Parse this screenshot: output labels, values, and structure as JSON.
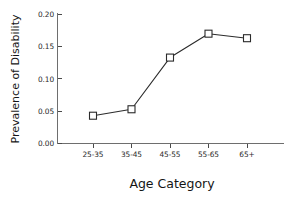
{
  "chart_data": {
    "type": "line",
    "title": "",
    "xlabel": "Age Category",
    "ylabel": "Prevalence of Disability",
    "categories": [
      "25-35",
      "35-45",
      "45-55",
      "55-65",
      "65+"
    ],
    "values": [
      0.043,
      0.053,
      0.133,
      0.17,
      0.163
    ],
    "series": [
      {
        "name": "Prevalence of Disability",
        "values": [
          0.043,
          0.053,
          0.133,
          0.17,
          0.163
        ]
      }
    ],
    "ylim": [
      0.0,
      0.2
    ],
    "ytick_labels": [
      "0.00",
      "0.05",
      "0.10",
      "0.15",
      "0.20"
    ],
    "ytick_values": [
      0.0,
      0.05,
      0.1,
      0.15,
      0.2
    ],
    "xtick_labels": [
      "25-35",
      "35-45",
      "45-55",
      "55-65",
      "65+"
    ],
    "grid": false,
    "legend": false,
    "legend_position": "none",
    "marker": "open-square",
    "line_color": "#2b2b2b",
    "marker_fill": "#ffffff",
    "background_color": "#ffffff"
  },
  "labels": {
    "y_axis_title": "Prevalence of Disability",
    "x_axis_title": "Age Category",
    "ytick_0": "0.00",
    "ytick_1": "0.05",
    "ytick_2": "0.10",
    "ytick_3": "0.15",
    "ytick_4": "0.20",
    "xtick_0": "25-35",
    "xtick_1": "35-45",
    "xtick_2": "45-55",
    "xtick_3": "55-65",
    "xtick_4": "65+"
  }
}
